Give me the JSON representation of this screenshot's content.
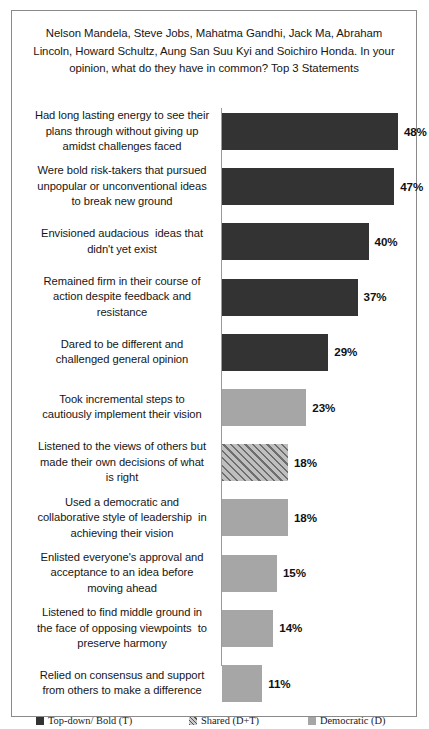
{
  "chart_data": {
    "type": "bar",
    "orientation": "horizontal",
    "title": "Nelson Mandela, Steve Jobs, Mahatma Gandhi, Jack Ma, Abraham Lincoln, Howard Schultz, Aung San Suu Kyi and Soichiro Honda. In your opinion, what do they have in common? Top 3 Statements",
    "xlabel": "",
    "ylabel": "",
    "xlim": [
      0,
      50
    ],
    "grid": false,
    "legend_position": "bottom",
    "value_suffix": "%",
    "categories": [
      "Had long lasting energy to see their plans through without giving up amidst challenges faced",
      "Were bold risk-takers that pursued unpopular or unconventional ideas to break new ground",
      "Envisioned audacious  ideas that didn't yet exist",
      "Remained firm in their course of action despite feedback and resistance",
      "Dared to be different and challenged general opinion",
      "Took incremental steps to cautiously implement their vision",
      "Listened to the views of others but made their own decisions of what is right",
      "Used a democratic and collaborative style of leadership  in achieving their vision",
      "Enlisted everyone's approval and acceptance to an idea before moving ahead",
      "Listened to find middle ground in the face of opposing viewpoints  to preserve harmony",
      "Relied on consensus and support from others to make a difference"
    ],
    "values": [
      48,
      47,
      40,
      37,
      29,
      23,
      18,
      18,
      15,
      14,
      11
    ],
    "value_labels": [
      "48%",
      "47%",
      "40%",
      "37%",
      "29%",
      "23%",
      "18%",
      "18%",
      "15%",
      "14%",
      "11%"
    ],
    "series_of_bar": [
      "topdown",
      "topdown",
      "topdown",
      "topdown",
      "topdown",
      "democratic",
      "shared",
      "democratic",
      "democratic",
      "democratic",
      "democratic"
    ],
    "legend": [
      {
        "key": "topdown",
        "label": "Top-down/ Bold (T)",
        "color": "#333333"
      },
      {
        "key": "shared",
        "label": "Shared (D+T)",
        "color": "#a6a6a6"
      },
      {
        "key": "democratic",
        "label": "Democratic (D)",
        "color": "#a6a6a6"
      }
    ]
  },
  "bars": [
    {
      "label": "Had long lasting energy to see their\nplans through without giving up\namidst challenges faced",
      "value_label": "48%"
    },
    {
      "label": "Were bold risk-takers that pursued\nunpopular or unconventional ideas\nto break new ground",
      "value_label": "47%"
    },
    {
      "label": "Envisioned audacious  ideas that\ndidn't yet exist",
      "value_label": "40%"
    },
    {
      "label": "Remained firm in their course of\naction despite feedback and\nresistance",
      "value_label": "37%"
    },
    {
      "label": "Dared to be different and\nchallenged general opinion",
      "value_label": "29%"
    },
    {
      "label": "Took incremental steps to\ncautiously implement their vision",
      "value_label": "23%"
    },
    {
      "label": "Listened to the views of others but\nmade their own decisions of what\nis right",
      "value_label": "18%"
    },
    {
      "label": "Used a democratic and\ncollaborative style of leadership  in\nachieving their vision",
      "value_label": "18%"
    },
    {
      "label": "Enlisted everyone's approval and\nacceptance to an idea before\nmoving ahead",
      "value_label": "15%"
    },
    {
      "label": "Listened to find middle ground in\nthe face of opposing viewpoints  to\npreserve harmony",
      "value_label": "14%"
    },
    {
      "label": "Relied on consensus and support\nfrom others to make a difference",
      "value_label": "11%"
    }
  ],
  "legend": {
    "topdown_label": "Top-down/ Bold (T)",
    "shared_label": "Shared (D+T)",
    "democratic_label": "Democratic (D)"
  }
}
